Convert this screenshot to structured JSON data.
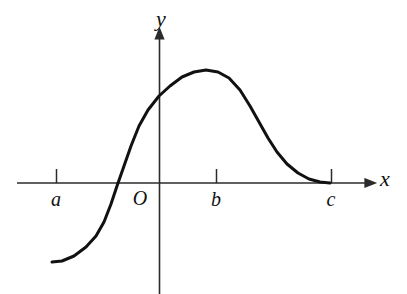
{
  "figure": {
    "background_color": "#ffffff",
    "stroke_color": "#111111",
    "axis_color": "#2b2b2b",
    "width": 407,
    "height": 294
  },
  "axes": {
    "x_axis": {
      "label": "x",
      "label_x": 385,
      "label_y": 186,
      "start_x": 17,
      "end_x": 372,
      "y": 183,
      "arrow": true
    },
    "y_axis": {
      "label": "y",
      "label_x": 161,
      "label_y": 26,
      "x": 159,
      "start_y": 294,
      "end_y": 32,
      "arrow": true
    },
    "origin": {
      "label": "O",
      "label_x": 140,
      "label_y": 205,
      "x": 159,
      "y": 183
    }
  },
  "ticks": [
    {
      "label": "a",
      "x": 56,
      "label_x": 56,
      "label_y": 206,
      "tick_top": 169,
      "tick_bottom": 183
    },
    {
      "label": "b",
      "x": 216,
      "label_x": 216,
      "label_y": 206,
      "tick_top": 169,
      "tick_bottom": 183
    },
    {
      "label": "c",
      "x": 331,
      "label_x": 331,
      "label_y": 206,
      "tick_top": 169,
      "tick_bottom": 183
    }
  ],
  "chart_data": {
    "type": "line",
    "title": "",
    "xlabel": "x",
    "ylabel": "y",
    "grid": false,
    "legend": null,
    "xlim": [
      17,
      372
    ],
    "ylim": [
      294,
      32
    ],
    "series": [
      {
        "name": "y = f(x)",
        "description": "Smooth S-shaped curve: begins flat at the lower left below the x-axis, rises steeply crossing the x-axis between a and O, reaches a maximum near x = b, then decreases and flattens out tangentially to the x-axis at x = c.",
        "stroke_width": 3,
        "points_px": [
          [
            52,
            262
          ],
          [
            62,
            261
          ],
          [
            74,
            256
          ],
          [
            86,
            247
          ],
          [
            96,
            236
          ],
          [
            104,
            222
          ],
          [
            111,
            204
          ],
          [
            117,
            186
          ],
          [
            124,
            166
          ],
          [
            131,
            146
          ],
          [
            139,
            126
          ],
          [
            148,
            110
          ],
          [
            159,
            96
          ],
          [
            170,
            86
          ],
          [
            182,
            77
          ],
          [
            194,
            72
          ],
          [
            206,
            70
          ],
          [
            218,
            72
          ],
          [
            229,
            78
          ],
          [
            240,
            90
          ],
          [
            250,
            106
          ],
          [
            259,
            122
          ],
          [
            268,
            138
          ],
          [
            277,
            152
          ],
          [
            287,
            164
          ],
          [
            298,
            173
          ],
          [
            309,
            179
          ],
          [
            320,
            182
          ],
          [
            330,
            183
          ]
        ],
        "key_features": {
          "left_endpoint": {
            "x": 52,
            "y": 262
          },
          "x_intercept": {
            "x": 112,
            "y": 183,
            "label": "between a and O"
          },
          "y_intercept": {
            "x": 159,
            "y": 96
          },
          "maximum": {
            "x": 206,
            "y": 70,
            "label": "near b"
          },
          "right_endpoint": {
            "x": 330,
            "y": 183,
            "label": "at c, tangent to x-axis"
          }
        }
      }
    ]
  }
}
